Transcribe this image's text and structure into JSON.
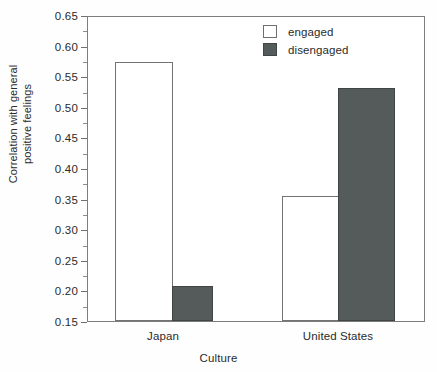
{
  "chart_data": {
    "type": "bar",
    "title": "",
    "xlabel": "Culture",
    "ylabel_lines": [
      "Correlation with general",
      "positive feelings"
    ],
    "ylabel": "Correlation with general positive feelings",
    "categories": [
      "Japan",
      "United States"
    ],
    "series": [
      {
        "name": "engaged",
        "values": [
          0.573,
          0.355
        ],
        "color": "#ffffff",
        "edge_color": "#737373"
      },
      {
        "name": "disengaged",
        "values": [
          0.207,
          0.53
        ],
        "color": "#555a5a",
        "edge_color": "#3f4444"
      }
    ],
    "ylim": [
      0.15,
      0.65
    ],
    "ytick_values": [
      0.65,
      0.6,
      0.55,
      0.5,
      0.45,
      0.4,
      0.35,
      0.3,
      0.25,
      0.2,
      0.15
    ],
    "ytick_labels": [
      "0.65",
      "0.60",
      "0.55",
      "0.50",
      "0.45",
      "0.40",
      "0.35",
      "0.30",
      "0.25",
      "0.20",
      "0.15"
    ],
    "minor_ticks": true,
    "grid": false,
    "legend_position": "top-right",
    "legend_entries": [
      "engaged",
      "disengaged"
    ]
  },
  "axes": {
    "x_title": "Culture",
    "y_title_line1": "Correlation with general",
    "y_title_line2": "positive feelings",
    "category_labels": [
      "Japan",
      "United States"
    ]
  },
  "legend": {
    "items": [
      {
        "label": "engaged"
      },
      {
        "label": "disengaged"
      }
    ]
  },
  "colors": {
    "disengaged_fill": "#555a5a",
    "engaged_fill": "#ffffff",
    "frame": "#7d7d7d",
    "text": "#2b2b2b"
  }
}
